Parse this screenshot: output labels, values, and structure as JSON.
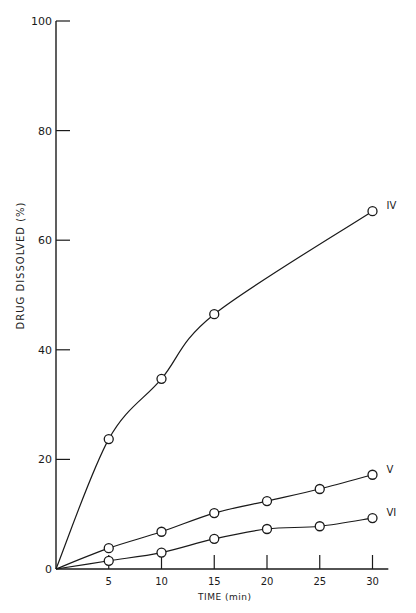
{
  "chart_data": {
    "type": "line",
    "title": "",
    "xlabel": "TIME (min)",
    "ylabel": "DRUG DISSOLVED (%)",
    "xlim": [
      0,
      31
    ],
    "ylim": [
      0,
      100
    ],
    "x_ticks": [
      5,
      10,
      15,
      20,
      25,
      30
    ],
    "y_ticks": [
      0,
      20,
      40,
      60,
      80,
      100
    ],
    "grid": false,
    "legend_position": "inline labels at series ends",
    "x": [
      0,
      5,
      10,
      15,
      20,
      25,
      30
    ],
    "series": [
      {
        "name": "IV",
        "x": [
          0,
          5,
          10,
          15,
          30
        ],
        "values": [
          0,
          23.7,
          34.7,
          46.5,
          65.3
        ]
      },
      {
        "name": "V",
        "x": [
          0,
          5,
          10,
          15,
          20,
          25,
          30
        ],
        "values": [
          0,
          3.8,
          6.8,
          10.2,
          12.4,
          14.6,
          17.2
        ]
      },
      {
        "name": "VI",
        "x": [
          0,
          5,
          10,
          15,
          20,
          25,
          30
        ],
        "values": [
          0,
          1.5,
          3.0,
          5.5,
          7.3,
          7.8,
          9.3
        ]
      }
    ]
  },
  "labels": {
    "xlabel": "TIME (min)",
    "ylabel": "DRUG DISSOLVED (%)"
  },
  "colors": {
    "ink": "#1a1a1a",
    "background": "#ffffff"
  }
}
